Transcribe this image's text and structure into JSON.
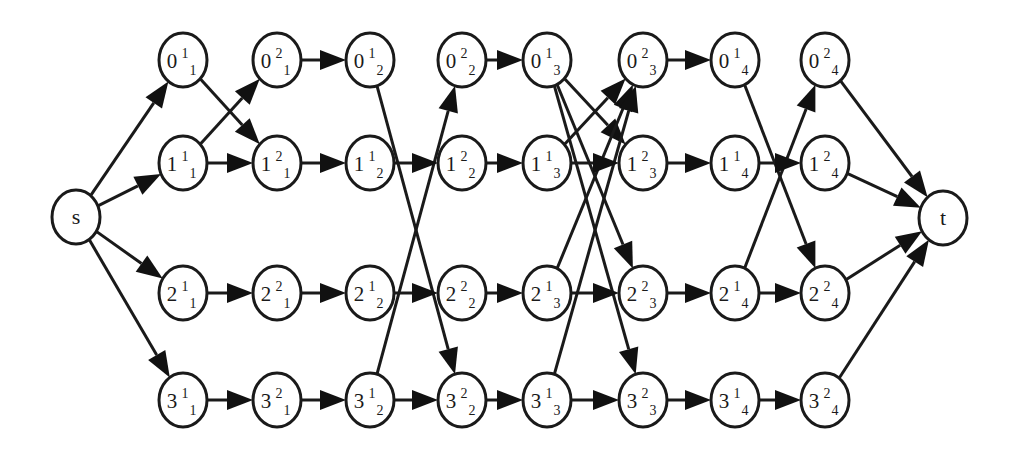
{
  "diagram": {
    "type": "directed-layered-graph",
    "colors": {
      "stroke": "#1a1a1a",
      "fill": "#ffffff",
      "arrow": "#111111"
    },
    "node_radius": {
      "rx": 24,
      "ry": 27
    },
    "nodes": [
      {
        "id": "s",
        "label": "s",
        "x": 76,
        "y": 217
      },
      {
        "id": "t",
        "label": "t",
        "x": 943,
        "y": 218
      },
      {
        "id": "0_1_1",
        "base": "0",
        "sup": "1",
        "sub": "1",
        "x": 183,
        "y": 60
      },
      {
        "id": "1_1_1",
        "base": "1",
        "sup": "1",
        "sub": "1",
        "x": 183,
        "y": 163
      },
      {
        "id": "2_1_1",
        "base": "2",
        "sup": "1",
        "sub": "1",
        "x": 183,
        "y": 293
      },
      {
        "id": "3_1_1",
        "base": "3",
        "sup": "1",
        "sub": "1",
        "x": 183,
        "y": 400
      },
      {
        "id": "0_2_1",
        "base": "0",
        "sup": "2",
        "sub": "1",
        "x": 277,
        "y": 60
      },
      {
        "id": "1_2_1",
        "base": "1",
        "sup": "2",
        "sub": "1",
        "x": 277,
        "y": 163
      },
      {
        "id": "2_2_1",
        "base": "2",
        "sup": "2",
        "sub": "1",
        "x": 277,
        "y": 293
      },
      {
        "id": "3_2_1",
        "base": "3",
        "sup": "2",
        "sub": "1",
        "x": 277,
        "y": 400
      },
      {
        "id": "0_1_2",
        "base": "0",
        "sup": "1",
        "sub": "2",
        "x": 370,
        "y": 60
      },
      {
        "id": "1_1_2",
        "base": "1",
        "sup": "1",
        "sub": "2",
        "x": 370,
        "y": 163
      },
      {
        "id": "2_1_2",
        "base": "2",
        "sup": "1",
        "sub": "2",
        "x": 370,
        "y": 293
      },
      {
        "id": "3_1_2",
        "base": "3",
        "sup": "1",
        "sub": "2",
        "x": 370,
        "y": 400
      },
      {
        "id": "0_2_2",
        "base": "0",
        "sup": "2",
        "sub": "2",
        "x": 462,
        "y": 60
      },
      {
        "id": "1_2_2",
        "base": "1",
        "sup": "2",
        "sub": "2",
        "x": 462,
        "y": 163
      },
      {
        "id": "2_2_2",
        "base": "2",
        "sup": "2",
        "sub": "2",
        "x": 462,
        "y": 293
      },
      {
        "id": "3_2_2",
        "base": "3",
        "sup": "2",
        "sub": "2",
        "x": 462,
        "y": 400
      },
      {
        "id": "0_1_3",
        "base": "0",
        "sup": "1",
        "sub": "3",
        "x": 547,
        "y": 60
      },
      {
        "id": "1_1_3",
        "base": "1",
        "sup": "1",
        "sub": "3",
        "x": 547,
        "y": 163
      },
      {
        "id": "2_1_3",
        "base": "2",
        "sup": "1",
        "sub": "3",
        "x": 547,
        "y": 293
      },
      {
        "id": "3_1_3",
        "base": "3",
        "sup": "1",
        "sub": "3",
        "x": 547,
        "y": 400
      },
      {
        "id": "0_2_3",
        "base": "0",
        "sup": "2",
        "sub": "3",
        "x": 643,
        "y": 60
      },
      {
        "id": "1_2_3",
        "base": "1",
        "sup": "2",
        "sub": "3",
        "x": 643,
        "y": 163
      },
      {
        "id": "2_2_3",
        "base": "2",
        "sup": "2",
        "sub": "3",
        "x": 643,
        "y": 293
      },
      {
        "id": "3_2_3",
        "base": "3",
        "sup": "2",
        "sub": "3",
        "x": 643,
        "y": 400
      },
      {
        "id": "0_1_4",
        "base": "0",
        "sup": "1",
        "sub": "4",
        "x": 735,
        "y": 60
      },
      {
        "id": "1_1_4",
        "base": "1",
        "sup": "1",
        "sub": "4",
        "x": 735,
        "y": 163
      },
      {
        "id": "2_1_4",
        "base": "2",
        "sup": "1",
        "sub": "4",
        "x": 735,
        "y": 293
      },
      {
        "id": "3_1_4",
        "base": "3",
        "sup": "1",
        "sub": "4",
        "x": 735,
        "y": 400
      },
      {
        "id": "0_2_4",
        "base": "0",
        "sup": "2",
        "sub": "4",
        "x": 825,
        "y": 60
      },
      {
        "id": "1_2_4",
        "base": "1",
        "sup": "2",
        "sub": "4",
        "x": 825,
        "y": 163
      },
      {
        "id": "2_2_4",
        "base": "2",
        "sup": "2",
        "sub": "4",
        "x": 825,
        "y": 293
      },
      {
        "id": "3_2_4",
        "base": "3",
        "sup": "2",
        "sub": "4",
        "x": 825,
        "y": 400
      }
    ],
    "edges": [
      [
        "s",
        "0_1_1"
      ],
      [
        "s",
        "1_1_1"
      ],
      [
        "s",
        "2_1_1"
      ],
      [
        "s",
        "3_1_1"
      ],
      [
        "0_1_1",
        "1_2_1"
      ],
      [
        "1_1_1",
        "0_2_1"
      ],
      [
        "1_1_1",
        "1_2_1"
      ],
      [
        "2_1_1",
        "2_2_1"
      ],
      [
        "3_1_1",
        "3_2_1"
      ],
      [
        "0_2_1",
        "0_1_2"
      ],
      [
        "1_2_1",
        "1_1_2"
      ],
      [
        "2_2_1",
        "2_1_2"
      ],
      [
        "3_2_1",
        "3_1_2"
      ],
      [
        "0_1_2",
        "3_2_2"
      ],
      [
        "3_1_2",
        "0_2_2"
      ],
      [
        "1_1_2",
        "1_2_2"
      ],
      [
        "2_1_2",
        "2_2_2"
      ],
      [
        "3_1_2",
        "3_2_2"
      ],
      [
        "0_2_2",
        "0_1_3"
      ],
      [
        "1_2_2",
        "1_1_3"
      ],
      [
        "2_2_2",
        "2_1_3"
      ],
      [
        "3_2_2",
        "3_1_3"
      ],
      [
        "0_1_3",
        "1_2_3"
      ],
      [
        "0_1_3",
        "2_2_3"
      ],
      [
        "0_1_3",
        "3_2_3"
      ],
      [
        "1_1_3",
        "0_2_3"
      ],
      [
        "2_1_3",
        "0_2_3"
      ],
      [
        "3_1_3",
        "0_2_3"
      ],
      [
        "1_1_3",
        "1_2_3"
      ],
      [
        "2_1_3",
        "2_2_3"
      ],
      [
        "3_1_3",
        "3_2_3"
      ],
      [
        "0_2_3",
        "0_1_4"
      ],
      [
        "1_2_3",
        "1_1_4"
      ],
      [
        "2_2_3",
        "2_1_4"
      ],
      [
        "3_2_3",
        "3_1_4"
      ],
      [
        "0_1_4",
        "2_2_4"
      ],
      [
        "2_1_4",
        "0_2_4"
      ],
      [
        "1_1_4",
        "1_2_4"
      ],
      [
        "2_1_4",
        "2_2_4"
      ],
      [
        "3_1_4",
        "3_2_4"
      ],
      [
        "0_2_4",
        "t"
      ],
      [
        "1_2_4",
        "t"
      ],
      [
        "2_2_4",
        "t"
      ],
      [
        "3_2_4",
        "t"
      ]
    ]
  }
}
